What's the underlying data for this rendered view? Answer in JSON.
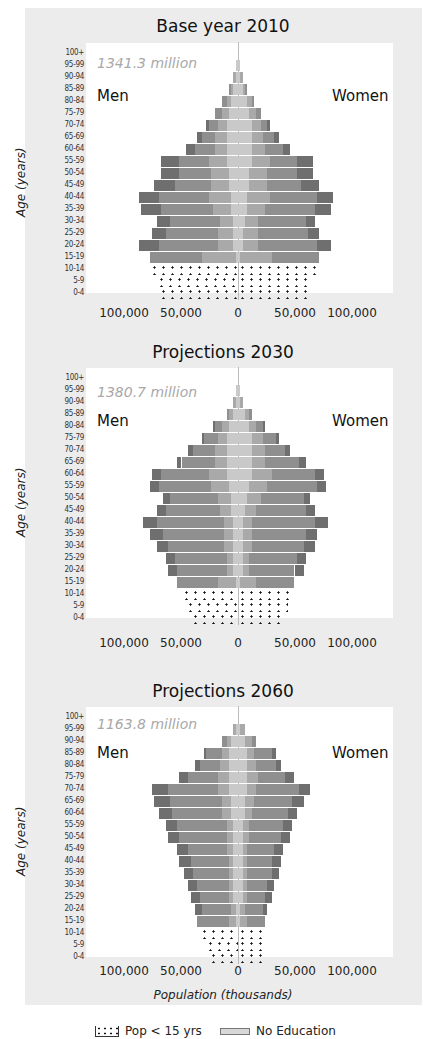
{
  "colors": {
    "frame": "#ececec",
    "plot_bg": "#ffffff",
    "seg_no_education": "#c9c9c9",
    "seg_primary": "#a9a9a9",
    "seg_secondary": "#8f8f8f",
    "seg_tertiary": "#6f6f6f",
    "total_label": "#a8a8a8"
  },
  "legend": {
    "items": [
      {
        "label": "Pop < 15 yrs",
        "swatch": "dots"
      },
      {
        "label": "No Education",
        "swatch": "no-education"
      }
    ]
  },
  "chart_data": [
    {
      "type": "bar",
      "subtype": "population-pyramid",
      "title": "Base year 2010",
      "total_label": "1341.3 million",
      "left_label": "Men",
      "right_label": "Women",
      "ylabel": "Age (years)",
      "xlabel": "",
      "xticks": [
        "100,000",
        "50,000",
        "0",
        "50,000",
        "100,000"
      ],
      "xlim": [
        -100000,
        100000
      ],
      "units": "thousands",
      "categories": [
        "100+",
        "95-99",
        "90-94",
        "85-89",
        "80-84",
        "75-79",
        "70-74",
        "65-69",
        "60-64",
        "55-59",
        "50-54",
        "45-49",
        "40-44",
        "35-39",
        "30-34",
        "25-29",
        "20-24",
        "15-19",
        "10-14",
        "5-9",
        "0-4"
      ],
      "segments": [
        "No Education",
        "Primary",
        "Secondary",
        "Tertiary"
      ],
      "men": [
        0,
        1,
        2,
        4,
        7,
        10,
        14,
        18,
        23,
        34,
        34,
        37,
        44,
        43,
        36,
        38,
        44,
        39,
        39,
        36,
        35
      ],
      "women": [
        0,
        1,
        2,
        4,
        7,
        10,
        14,
        18,
        23,
        33,
        33,
        36,
        42,
        41,
        34,
        36,
        41,
        36,
        37,
        33,
        31
      ],
      "men_split": [
        [
          0,
          0,
          0,
          0
        ],
        [
          1,
          0,
          0,
          0
        ],
        [
          1,
          1,
          0,
          0
        ],
        [
          2,
          1,
          1,
          0
        ],
        [
          3,
          2,
          2,
          0
        ],
        [
          4,
          3,
          3,
          0
        ],
        [
          5,
          4,
          4,
          1
        ],
        [
          5,
          5,
          6,
          2
        ],
        [
          5,
          5,
          9,
          4
        ],
        [
          5,
          8,
          13,
          8
        ],
        [
          4,
          8,
          14,
          8
        ],
        [
          4,
          8,
          16,
          9
        ],
        [
          3,
          10,
          22,
          9
        ],
        [
          3,
          8,
          23,
          9
        ],
        [
          2,
          6,
          22,
          6
        ],
        [
          2,
          7,
          23,
          6
        ],
        [
          2,
          7,
          26,
          9
        ],
        [
          1,
          15,
          23,
          0
        ],
        [
          39,
          0,
          0,
          0
        ],
        [
          36,
          0,
          0,
          0
        ],
        [
          35,
          0,
          0,
          0
        ]
      ],
      "women_split": [
        [
          0,
          0,
          0,
          0
        ],
        [
          1,
          0,
          0,
          0
        ],
        [
          1,
          1,
          0,
          0
        ],
        [
          2,
          1,
          1,
          0
        ],
        [
          4,
          2,
          1,
          0
        ],
        [
          5,
          3,
          2,
          0
        ],
        [
          6,
          4,
          3,
          1
        ],
        [
          6,
          5,
          5,
          2
        ],
        [
          6,
          6,
          8,
          3
        ],
        [
          6,
          8,
          12,
          7
        ],
        [
          5,
          8,
          13,
          7
        ],
        [
          5,
          8,
          15,
          8
        ],
        [
          4,
          10,
          21,
          7
        ],
        [
          4,
          8,
          22,
          7
        ],
        [
          3,
          6,
          21,
          4
        ],
        [
          2,
          7,
          22,
          5
        ],
        [
          2,
          7,
          26,
          6
        ],
        [
          1,
          14,
          21,
          0
        ],
        [
          37,
          0,
          0,
          0
        ],
        [
          33,
          0,
          0,
          0
        ],
        [
          31,
          0,
          0,
          0
        ]
      ]
    },
    {
      "type": "bar",
      "subtype": "population-pyramid",
      "title": "Projections 2030",
      "total_label": "1380.7 million",
      "left_label": "Men",
      "right_label": "Women",
      "ylabel": "Age (years)",
      "xlabel": "",
      "xticks": [
        "100,000",
        "50,000",
        "0",
        "50,000",
        "100,000"
      ],
      "xlim": [
        -100000,
        100000
      ],
      "units": "thousands",
      "categories": [
        "100+",
        "95-99",
        "90-94",
        "85-89",
        "80-84",
        "75-79",
        "70-74",
        "65-69",
        "60-64",
        "55-59",
        "50-54",
        "45-49",
        "40-44",
        "35-39",
        "30-34",
        "25-29",
        "20-24",
        "15-19",
        "10-14",
        "5-9",
        "0-4"
      ],
      "segments": [
        "No Education",
        "Primary",
        "Secondary",
        "Tertiary"
      ],
      "men": [
        0,
        1,
        2,
        5,
        11,
        16,
        22,
        27,
        38,
        39,
        33,
        36,
        42,
        39,
        36,
        32,
        31,
        27,
        25,
        23,
        21
      ],
      "women": [
        0,
        1,
        2,
        6,
        12,
        18,
        23,
        30,
        38,
        39,
        32,
        34,
        40,
        35,
        34,
        30,
        29,
        25,
        24,
        22,
        20
      ],
      "men_split": [
        [
          0,
          0,
          0,
          0
        ],
        [
          1,
          0,
          0,
          0
        ],
        [
          1,
          1,
          0,
          0
        ],
        [
          2,
          2,
          1,
          0
        ],
        [
          4,
          3,
          3,
          1
        ],
        [
          5,
          4,
          6,
          1
        ],
        [
          5,
          5,
          10,
          2
        ],
        [
          5,
          5,
          15,
          2
        ],
        [
          5,
          8,
          21,
          4
        ],
        [
          4,
          8,
          23,
          4
        ],
        [
          3,
          6,
          21,
          3
        ],
        [
          3,
          5,
          24,
          4
        ],
        [
          2,
          4,
          30,
          6
        ],
        [
          2,
          4,
          27,
          6
        ],
        [
          2,
          4,
          25,
          5
        ],
        [
          2,
          3,
          23,
          4
        ],
        [
          2,
          3,
          22,
          4
        ],
        [
          1,
          8,
          18,
          0
        ],
        [
          25,
          0,
          0,
          0
        ],
        [
          23,
          0,
          0,
          0
        ],
        [
          21,
          0,
          0,
          0
        ]
      ],
      "women_split": [
        [
          0,
          0,
          0,
          0
        ],
        [
          1,
          0,
          0,
          0
        ],
        [
          1,
          1,
          0,
          0
        ],
        [
          3,
          2,
          1,
          0
        ],
        [
          5,
          3,
          3,
          1
        ],
        [
          6,
          5,
          6,
          1
        ],
        [
          6,
          6,
          9,
          2
        ],
        [
          6,
          6,
          15,
          3
        ],
        [
          6,
          9,
          19,
          4
        ],
        [
          5,
          8,
          22,
          4
        ],
        [
          4,
          6,
          19,
          3
        ],
        [
          3,
          5,
          22,
          4
        ],
        [
          2,
          4,
          28,
          6
        ],
        [
          2,
          4,
          24,
          5
        ],
        [
          2,
          4,
          23,
          5
        ],
        [
          2,
          3,
          21,
          4
        ],
        [
          2,
          3,
          20,
          4
        ],
        [
          1,
          7,
          17,
          0
        ],
        [
          24,
          0,
          0,
          0
        ],
        [
          22,
          0,
          0,
          0
        ],
        [
          20,
          0,
          0,
          0
        ]
      ]
    },
    {
      "type": "bar",
      "subtype": "population-pyramid",
      "title": "Projections 2060",
      "total_label": "1163.8 million",
      "left_label": "Men",
      "right_label": "Women",
      "ylabel": "Age (years)",
      "xlabel": "Population (thousands)",
      "xticks": [
        "100,000",
        "50,000",
        "0",
        "50,000",
        "100,000"
      ],
      "xlim": [
        -100000,
        100000
      ],
      "units": "thousands",
      "categories": [
        "100+",
        "95-99",
        "90-94",
        "85-89",
        "80-84",
        "75-79",
        "70-74",
        "65-69",
        "60-64",
        "55-59",
        "50-54",
        "45-49",
        "40-44",
        "35-39",
        "30-34",
        "25-29",
        "20-24",
        "15-19",
        "10-14",
        "5-9",
        "0-4"
      ],
      "segments": [
        "No Education",
        "Primary",
        "Secondary",
        "Tertiary"
      ],
      "men": [
        0,
        2,
        7,
        15,
        19,
        26,
        38,
        37,
        35,
        32,
        31,
        27,
        26,
        24,
        22,
        21,
        19,
        18,
        17,
        14,
        13
      ],
      "women": [
        0,
        3,
        8,
        17,
        19,
        25,
        32,
        29,
        26,
        24,
        23,
        20,
        19,
        18,
        16,
        15,
        13,
        12,
        13,
        13,
        12
      ],
      "men_split": [
        [
          0,
          0,
          0,
          0
        ],
        [
          1,
          1,
          0,
          0
        ],
        [
          3,
          2,
          2,
          0
        ],
        [
          4,
          3,
          7,
          1
        ],
        [
          4,
          4,
          9,
          2
        ],
        [
          4,
          5,
          13,
          4
        ],
        [
          4,
          5,
          22,
          7
        ],
        [
          3,
          4,
          23,
          7
        ],
        [
          3,
          4,
          22,
          6
        ],
        [
          2,
          3,
          22,
          5
        ],
        [
          2,
          3,
          21,
          5
        ],
        [
          2,
          3,
          17,
          5
        ],
        [
          2,
          2,
          17,
          5
        ],
        [
          2,
          2,
          16,
          4
        ],
        [
          2,
          2,
          14,
          4
        ],
        [
          2,
          2,
          13,
          4
        ],
        [
          1,
          2,
          13,
          3
        ],
        [
          1,
          3,
          14,
          0
        ],
        [
          17,
          0,
          0,
          0
        ],
        [
          14,
          0,
          0,
          0
        ],
        [
          13,
          0,
          0,
          0
        ]
      ],
      "women_split": [
        [
          0,
          0,
          0,
          0
        ],
        [
          1,
          2,
          0,
          0
        ],
        [
          3,
          3,
          2,
          0
        ],
        [
          4,
          3,
          8,
          2
        ],
        [
          4,
          4,
          9,
          2
        ],
        [
          4,
          5,
          12,
          4
        ],
        [
          4,
          4,
          19,
          5
        ],
        [
          3,
          4,
          17,
          5
        ],
        [
          3,
          3,
          16,
          4
        ],
        [
          2,
          3,
          15,
          4
        ],
        [
          2,
          3,
          14,
          4
        ],
        [
          2,
          2,
          12,
          4
        ],
        [
          2,
          2,
          11,
          4
        ],
        [
          2,
          2,
          11,
          3
        ],
        [
          2,
          2,
          9,
          3
        ],
        [
          2,
          2,
          8,
          3
        ],
        [
          1,
          2,
          8,
          2
        ],
        [
          1,
          3,
          8,
          0
        ],
        [
          13,
          0,
          0,
          0
        ],
        [
          13,
          0,
          0,
          0
        ],
        [
          12,
          0,
          0,
          0
        ]
      ]
    }
  ]
}
